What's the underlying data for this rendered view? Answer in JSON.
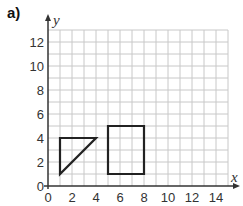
{
  "question_label": "a)",
  "chart_data": {
    "type": "diagram",
    "title": "",
    "xlabel": "x",
    "ylabel": "y",
    "xlim": [
      0,
      15
    ],
    "ylim": [
      0,
      13
    ],
    "grid": true,
    "x_ticks": [
      "0",
      "2",
      "4",
      "6",
      "8",
      "10",
      "12",
      "14"
    ],
    "y_ticks": [
      "0",
      "2",
      "4",
      "6",
      "8",
      "10",
      "12"
    ],
    "shapes": [
      {
        "name": "triangle",
        "vertices": [
          [
            1,
            1
          ],
          [
            1,
            4
          ],
          [
            4,
            4
          ]
        ]
      },
      {
        "name": "rectangle",
        "vertices": [
          [
            5,
            1
          ],
          [
            5,
            5
          ],
          [
            8,
            5
          ],
          [
            8,
            1
          ]
        ]
      }
    ]
  },
  "colors": {
    "grid": "#c8c8c8",
    "axis": "#333333",
    "shape": "#222222"
  }
}
